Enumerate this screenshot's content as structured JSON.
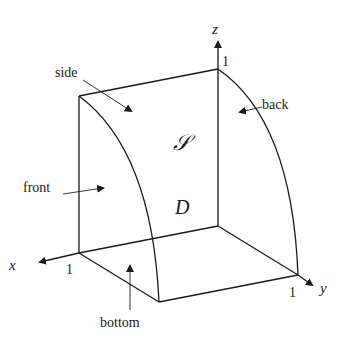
{
  "diagram": {
    "title": "",
    "axes": {
      "x": {
        "label": "x",
        "tick": "1"
      },
      "y": {
        "label": "y",
        "tick": "1"
      },
      "z": {
        "label": "z",
        "tick": "1"
      }
    },
    "surface_labels": {
      "side": "side",
      "back": "back",
      "front": "front",
      "bottom": "bottom"
    },
    "region_labels": {
      "surface": "𝒮",
      "domain": "D"
    },
    "colors": {
      "line": "#1a1a1a",
      "background": "#ffffff"
    }
  }
}
